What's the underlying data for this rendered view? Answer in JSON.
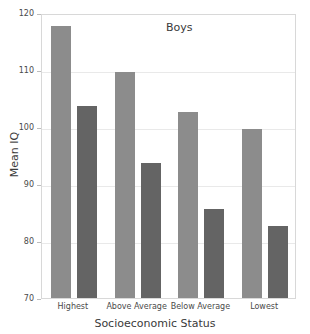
{
  "chart_data": {
    "type": "bar",
    "title": "Boys",
    "xlabel": "Socioeconomic Status",
    "ylabel": "Mean IQ",
    "categories": [
      "Highest",
      "Above Average",
      "Below Average",
      "Lowest"
    ],
    "series": [
      {
        "name": "series-light",
        "color": "#8c8c8c",
        "values": [
          118,
          110,
          103,
          100
        ]
      },
      {
        "name": "series-dark",
        "color": "#646464",
        "values": [
          104,
          94,
          86,
          83
        ]
      }
    ],
    "ylim": [
      70,
      120
    ],
    "yticks": [
      70,
      80,
      90,
      100,
      110,
      120
    ],
    "ytick_labels": [
      "70",
      "80",
      "90",
      "100",
      "110",
      "120"
    ],
    "grid": true,
    "legend": "none"
  },
  "axes": {
    "y_title": "Mean IQ",
    "x_title": "Socioeconomic Status"
  },
  "colors": {
    "light_bar": "#8c8c8c",
    "dark_bar": "#646464",
    "gridline": "#e9e9e9",
    "frame": "#d8d8d8",
    "text": "#3a3a3a",
    "background": "#ffffff"
  }
}
